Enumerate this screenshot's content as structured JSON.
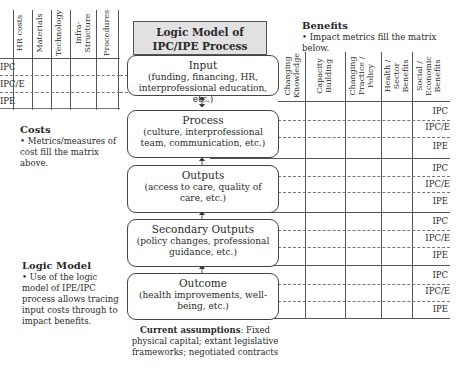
{
  "title": "Logic Model of IPC/IPE Process",
  "cost_matrix": {
    "columns": [
      "HR costs",
      "Materials",
      "Technology",
      "Infra-\nStructure",
      "Procedures"
    ],
    "rows": [
      "IPC",
      "IPC/E",
      "IPE"
    ]
  },
  "costs_note": {
    "heading": "Costs",
    "bullet": "• Metrics/measures of cost fill the matrix above."
  },
  "logic_note": {
    "heading": "Logic Model",
    "bullet": "• Use of the logic model of IPE/IPC process allows tracing input costs through to impact benefits."
  },
  "benefits": {
    "heading": "Benefits",
    "bullet": "• Impact metrics fill the matrix below.",
    "columns": [
      "Changing\nKnowledge",
      "Capacity\nBuilding",
      "Changing\nPractice /\nPolicy",
      "Health /\nSector\nBenefits",
      "Social /\nEconomic\nBenefits"
    ],
    "row_labels": [
      "IPC",
      "IPC/E",
      "IPE"
    ]
  },
  "stages": [
    {
      "name": "Input",
      "detail": "(funding, financing, HR, interprofessional education, etc.)"
    },
    {
      "name": "Process",
      "detail": "(culture, interprofessional team, communication, etc.)"
    },
    {
      "name": "Outputs",
      "detail": "(access to care, quality of care, etc.)"
    },
    {
      "name": "Secondary Outputs",
      "detail": "(policy changes, professional guidance, etc.)"
    },
    {
      "name": "Outcome",
      "detail": "(health improvements, well-being, etc.)"
    }
  ],
  "assumptions": {
    "label": "Current assumptions",
    "text": ": Fixed physical capital; extant legislative frameworks; negotiated contracts"
  }
}
